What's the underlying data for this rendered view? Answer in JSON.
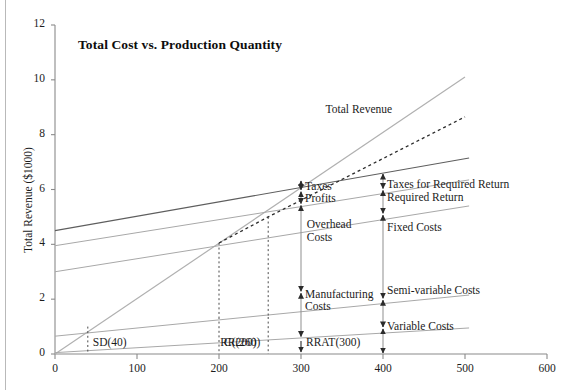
{
  "chart_data": {
    "type": "line",
    "title": "Total Cost vs. Production Quantity",
    "xlabel": "",
    "ylabel": "Total Revenue ($1000)",
    "xlim": [
      0,
      600
    ],
    "ylim": [
      0,
      12
    ],
    "xticks": [
      "0",
      "100",
      "200",
      "300",
      "400",
      "500",
      "600"
    ],
    "yticks": [
      "0",
      "2",
      "4",
      "6",
      "8",
      "10",
      "12"
    ],
    "grid": false,
    "legend_position": "inline-annotations",
    "series": [
      {
        "name": "Total Revenue",
        "points": [
          [
            0,
            0.0
          ],
          [
            500,
            10.1
          ]
        ]
      },
      {
        "name": "Total Cost (with taxes for required return)",
        "points": [
          [
            0,
            4.5
          ],
          [
            505,
            7.15
          ]
        ]
      },
      {
        "name": "Total Cost (with required return)",
        "points": [
          [
            0,
            3.95
          ],
          [
            505,
            6.35
          ]
        ]
      },
      {
        "name": "Total Cost (fixed + semi-variable + variable)",
        "points": [
          [
            0,
            3.0
          ],
          [
            505,
            5.4
          ]
        ]
      },
      {
        "name": "Semi-variable + Variable Costs",
        "points": [
          [
            0,
            0.65
          ],
          [
            505,
            2.15
          ]
        ]
      },
      {
        "name": "Variable Costs",
        "points": [
          [
            0,
            0.05
          ],
          [
            505,
            0.95
          ]
        ]
      },
      {
        "name": "Actual Revenue (dashed)",
        "points": [
          [
            200,
            4.05
          ],
          [
            260,
            5.0
          ],
          [
            500,
            8.65
          ]
        ]
      }
    ],
    "vertical_markers": [
      {
        "label": "SD(40)",
        "x": 40
      },
      {
        "label": "C(200)",
        "x": 200
      },
      {
        "label": "RR(260)",
        "x": 260
      }
    ],
    "point_markers": [
      {
        "label": "RRAT(300)",
        "x": 300
      }
    ],
    "annotations": [
      {
        "text": "Total Revenue",
        "x": 330,
        "y": 8.9
      },
      {
        "text": "Taxes",
        "x": 305,
        "y": 6.1
      },
      {
        "text": "Profits",
        "x": 305,
        "y": 5.65
      },
      {
        "text": "Overhead Costs",
        "x": 307,
        "y": 4.5
      },
      {
        "text": "Manufacturing Costs",
        "x": 305,
        "y": 1.95
      },
      {
        "text": "Taxes for Required Return",
        "x": 405,
        "y": 6.15
      },
      {
        "text": "Required Return",
        "x": 405,
        "y": 5.7
      },
      {
        "text": "Fixed Costs",
        "x": 405,
        "y": 4.6
      },
      {
        "text": "Semi-variable Costs",
        "x": 405,
        "y": 2.3
      },
      {
        "text": "Variable Costs",
        "x": 405,
        "y": 1.0
      }
    ],
    "bracket_columns": [
      {
        "x": 300,
        "brackets": [
          {
            "label": "Taxes",
            "from": 6.35,
            "to": 5.95
          },
          {
            "label": "Profits",
            "from": 5.95,
            "to": 5.45
          },
          {
            "label": "Overhead Costs",
            "from": 5.45,
            "to": 2.25
          },
          {
            "label": "Manufacturing Costs",
            "from": 2.25,
            "to": 0.6
          }
        ]
      },
      {
        "x": 400,
        "brackets": [
          {
            "label": "Taxes for Required Return",
            "from": 6.6,
            "to": 6.0
          },
          {
            "label": "Required Return",
            "from": 6.0,
            "to": 5.1
          },
          {
            "label": "Fixed Costs",
            "from": 5.1,
            "to": 2.0
          },
          {
            "label": "Semi-variable Costs",
            "from": 2.0,
            "to": 0.95
          },
          {
            "label": "Variable Costs",
            "from": 0.95,
            "to": 0.0
          }
        ]
      }
    ],
    "colors": {
      "axis": "#8a8a8a",
      "line_dark": "#5e5e5e",
      "line_light": "#a8a8a8",
      "revenue": "#b0b0b0",
      "dashed": "#2b2b2b",
      "text": "#1c1c1c"
    }
  }
}
